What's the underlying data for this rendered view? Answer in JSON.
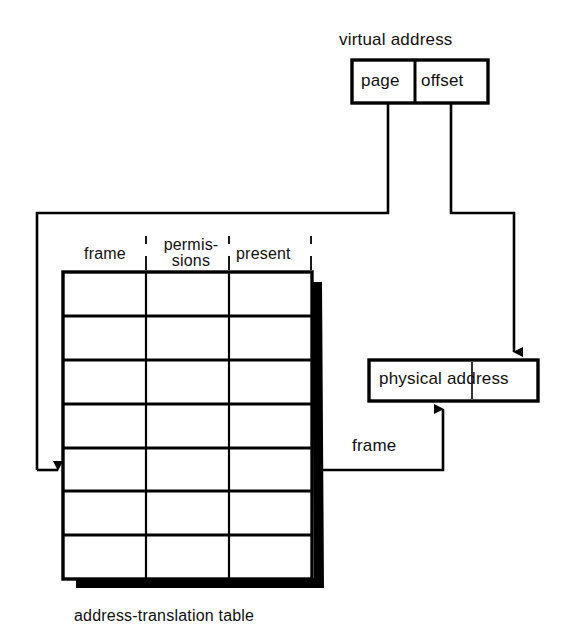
{
  "diagram": {
    "caption": "address-translation table",
    "colors": {
      "stroke": "#000000",
      "background": "#ffffff",
      "shadow": "#000000"
    },
    "virtual_address": {
      "label": "virtual address",
      "fields": [
        {
          "name": "page",
          "label": "page"
        },
        {
          "name": "offset",
          "label": "offset"
        }
      ]
    },
    "physical_address": {
      "label": "physical address",
      "fields": [
        {
          "name": "frame",
          "label": ""
        },
        {
          "name": "offset",
          "label": ""
        }
      ]
    },
    "table": {
      "caption": "address-translation table",
      "columns": [
        {
          "key": "frame",
          "label": "frame"
        },
        {
          "key": "permissions",
          "label_line1": "permis-",
          "label_line2": "sions"
        },
        {
          "key": "present",
          "label": "present"
        }
      ],
      "row_count": 7,
      "selected_row_index": 4,
      "rows": [
        {
          "frame": "",
          "permissions": "",
          "present": ""
        },
        {
          "frame": "",
          "permissions": "",
          "present": ""
        },
        {
          "frame": "",
          "permissions": "",
          "present": ""
        },
        {
          "frame": "",
          "permissions": "",
          "present": ""
        },
        {
          "frame": "",
          "permissions": "",
          "present": ""
        },
        {
          "frame": "",
          "permissions": "",
          "present": ""
        },
        {
          "frame": "",
          "permissions": "",
          "present": ""
        }
      ]
    },
    "connectors": [
      {
        "name": "page-to-table-index",
        "from": "virtual_address.page",
        "to": "table.selected_row",
        "label": ""
      },
      {
        "name": "offset-to-physical-offset",
        "from": "virtual_address.offset",
        "to": "physical_address.offset",
        "label": ""
      },
      {
        "name": "table-frame-to-physical-frame",
        "from": "table.selected_row.frame",
        "to": "physical_address.frame",
        "label": "frame"
      }
    ]
  }
}
